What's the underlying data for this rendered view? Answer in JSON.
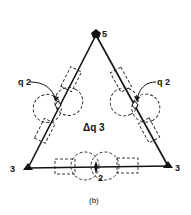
{
  "figure": {
    "caption": "(b)",
    "center_label": "Δq 3",
    "vertices": [
      {
        "id": "top",
        "label": "5",
        "marker": "pentagon"
      },
      {
        "id": "bottom-left",
        "label": "3",
        "marker": "triangle"
      },
      {
        "id": "bottom-right",
        "label": "3",
        "marker": "triangle"
      }
    ],
    "edge_midpoints": [
      {
        "id": "left",
        "label": "q 2",
        "marker": "diamond"
      },
      {
        "id": "right",
        "label": "q 2",
        "marker": "diamond"
      },
      {
        "id": "bottom",
        "label": "2",
        "marker": "diamond"
      }
    ],
    "colors": {
      "ink": "#111111",
      "background": "#ffffff"
    }
  }
}
